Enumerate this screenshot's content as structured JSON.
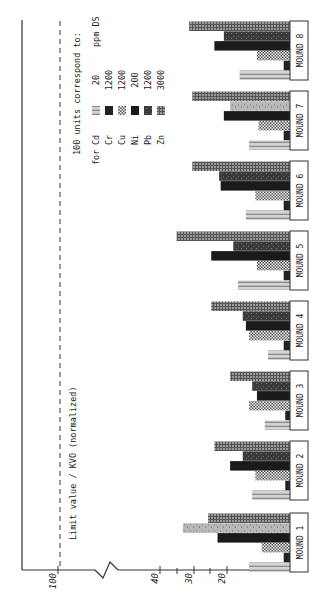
{
  "chart_data": {
    "type": "bar",
    "orientation": "rotated-90-ccw",
    "title": "",
    "ylabel": "Limit value / KVO (normalized)",
    "xlabel": "",
    "categories": [
      "MOUND 1",
      "MOUND 2",
      "MOUND 3",
      "MOUND 4",
      "MOUND 5",
      "MOUND 6",
      "MOUND 7",
      "MOUND 8"
    ],
    "series": [
      {
        "name": "Cd",
        "pattern": "horizontal-stripes-light",
        "values": [
          13,
          12,
          8,
          7,
          16.5,
          14,
          13,
          16
        ]
      },
      {
        "name": "Cr",
        "pattern": "solid-black",
        "values": [
          2,
          1.5,
          1.5,
          2,
          2,
          2,
          2,
          2
        ]
      },
      {
        "name": "Cu",
        "pattern": "checkered",
        "values": [
          9,
          11,
          13,
          13,
          10.5,
          11,
          10,
          10.5
        ]
      },
      {
        "name": "Ni",
        "pattern": "solid-black",
        "values": [
          23,
          19,
          10.5,
          14,
          25,
          22,
          21,
          24
        ]
      },
      {
        "name": "Pb",
        "pattern": "dark-mottled",
        "values": [
          34,
          15,
          12,
          15,
          18,
          22.5,
          19,
          21
        ]
      },
      {
        "name": "Zn",
        "pattern": "grid-gray",
        "values": [
          26,
          24,
          19,
          25,
          36,
          31,
          31,
          32
        ]
      }
    ],
    "yticks": [
      20,
      30,
      40,
      100
    ],
    "ylim": [
      0,
      100
    ],
    "axis_break": "between 40 and 100",
    "limit_line": {
      "value": 100,
      "style": "dashed",
      "label": "Limit value / KVO (normalized)"
    },
    "legend": {
      "title": "100 units correspond to:",
      "prefix": "for",
      "unit": "ppm DS",
      "entries": [
        {
          "element": "Cd",
          "value": "20"
        },
        {
          "element": "Cr",
          "value": "1200"
        },
        {
          "element": "Cu",
          "value": "1200"
        },
        {
          "element": "Ni",
          "value": "200"
        },
        {
          "element": "Pb",
          "value": "1200"
        },
        {
          "element": "Zn",
          "value": "3000"
        }
      ]
    }
  },
  "labels": {
    "tick_20": "20",
    "tick_30": "30",
    "tick_40": "40",
    "tick_100": "100",
    "limit_label": "Limit value / KVO (normalized)",
    "legend_title": "100 units correspond to:",
    "legend_for": "for",
    "legend_unit": "ppm DS",
    "legend_el_0": "Cd",
    "legend_val_0": "20",
    "legend_el_1": "Cr",
    "legend_val_1": "1200",
    "legend_el_2": "Cu",
    "legend_val_2": "1200",
    "legend_el_3": "Ni",
    "legend_val_3": "200",
    "legend_el_4": "Pb",
    "legend_val_4": "1200",
    "legend_el_5": "Zn",
    "legend_val_5": "3000",
    "mound_0": "MOUND 1",
    "mound_1": "MOUND 2",
    "mound_2": "MOUND 3",
    "mound_3": "MOUND 4",
    "mound_4": "MOUND 5",
    "mound_5": "MOUND 6",
    "mound_6": "MOUND 7",
    "mound_7": "MOUND 8"
  }
}
